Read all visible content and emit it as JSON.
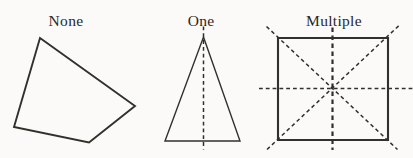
{
  "figures": [
    {
      "label": "None"
    },
    {
      "label": "One"
    },
    {
      "label": "Multiple"
    }
  ],
  "colors": {
    "stroke": "#33302c",
    "background": "#fbfaf8",
    "label_text": "#2b2824"
  },
  "geometry": {
    "none_polygon_points": "40,38 135,106 89,142.5 14,127",
    "one_triangle_points": "203.5,37 240,141 165,141",
    "one_axis_path": "M 203.5 26.5 L 203.5 149.5",
    "multiple_square_points": "278,38 388,38 388,140 278,140",
    "multiple_vertical_axis_path": "M 332.5 27.5 L 332.5 150",
    "multiple_horizontal_axis_path": "M 259 88.5 L 412.5 88.5",
    "multiple_diagonal_axis_1_path": "M 266.5 26.5 L 397.5 149.5",
    "multiple_diagonal_axis_2_path": "M 267 149.5 L 399 25.5"
  }
}
